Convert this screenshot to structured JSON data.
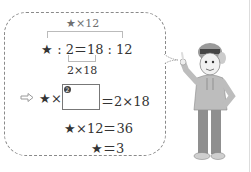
{
  "figure": {
    "top_label": "★×12",
    "ratio_equation": "★ : 2＝18 : 12",
    "bottom_label": "2×18",
    "step1": {
      "prefix": "★×",
      "blank_number": "❷",
      "suffix": "＝2×18"
    },
    "step2": "★×12＝36",
    "step3": "★＝3"
  },
  "icons": {
    "arrow": "hollow-right-arrow",
    "character": "boy-with-cap-pointing"
  }
}
